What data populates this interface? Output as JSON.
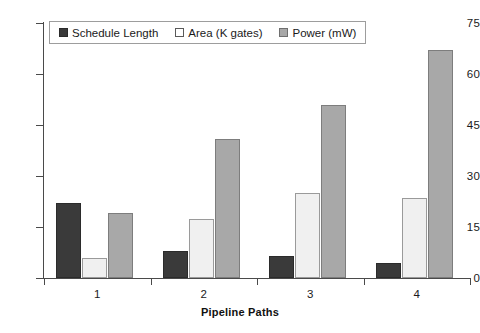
{
  "chart_data": {
    "type": "bar",
    "title": "",
    "xlabel": "Pipeline Paths",
    "ylabel": "",
    "categories": [
      "1",
      "2",
      "3",
      "4"
    ],
    "yticks": [
      0,
      15,
      30,
      45,
      60,
      75
    ],
    "ylim": [
      0,
      75
    ],
    "grid": false,
    "legend_position": "top-left",
    "series": [
      {
        "name": "Schedule Length",
        "color": "#3a3a3a",
        "values": [
          22,
          8,
          6.5,
          4.5
        ]
      },
      {
        "name": "Area (K gates)",
        "color": "#f0f0f0",
        "values": [
          6,
          17.5,
          25,
          23.5
        ]
      },
      {
        "name": "Power (mW)",
        "color": "#a8a8a8",
        "values": [
          19,
          41,
          51,
          67
        ]
      }
    ]
  }
}
